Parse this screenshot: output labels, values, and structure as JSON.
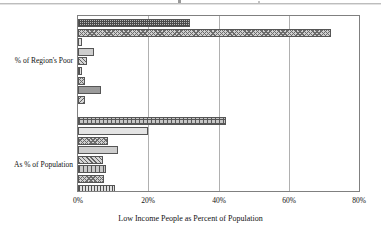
{
  "chart_data": {
    "type": "bar",
    "orientation": "horizontal",
    "title": "",
    "xlabel": "Low Income People as Percent of Population",
    "ylabel": "",
    "categories": [
      "% of Region's Poor",
      "As % of Population"
    ],
    "xlim": [
      0,
      80
    ],
    "xticks": [
      "0%",
      "20%",
      "40%",
      "60%",
      "80%"
    ],
    "xtick_values": [
      0,
      20,
      40,
      60,
      80
    ],
    "grid": true,
    "legend": "none",
    "groups": [
      {
        "category": "% of Region's Poor",
        "bars": [
          {
            "value": 32.0,
            "pattern": "crosshatch-dense"
          },
          {
            "value": 72.0,
            "pattern": "checker"
          },
          {
            "value": 1.0,
            "pattern": "dots"
          },
          {
            "value": 4.5,
            "pattern": "solid-light"
          },
          {
            "value": 2.5,
            "pattern": "diag-right"
          },
          {
            "value": 1.0,
            "pattern": "vert"
          },
          {
            "value": 2.0,
            "pattern": "checker"
          },
          {
            "value": 6.5,
            "pattern": "solid-dark"
          },
          {
            "value": 2.0,
            "pattern": "diag-left"
          }
        ]
      },
      {
        "category": "As % of Population",
        "bars": [
          {
            "value": 42.0,
            "pattern": "grid-wide"
          },
          {
            "value": 20.0,
            "pattern": "dots"
          },
          {
            "value": 8.5,
            "pattern": "checker"
          },
          {
            "value": 11.5,
            "pattern": "solid-light"
          },
          {
            "value": 7.0,
            "pattern": "diag-right"
          },
          {
            "value": 8.0,
            "pattern": "vert-wide"
          },
          {
            "value": 7.5,
            "pattern": "checker"
          },
          {
            "value": 10.5,
            "pattern": "vert"
          },
          {
            "value": 14.0,
            "pattern": "solid-dark"
          },
          {
            "value": 12.0,
            "pattern": "checker"
          }
        ]
      }
    ]
  }
}
